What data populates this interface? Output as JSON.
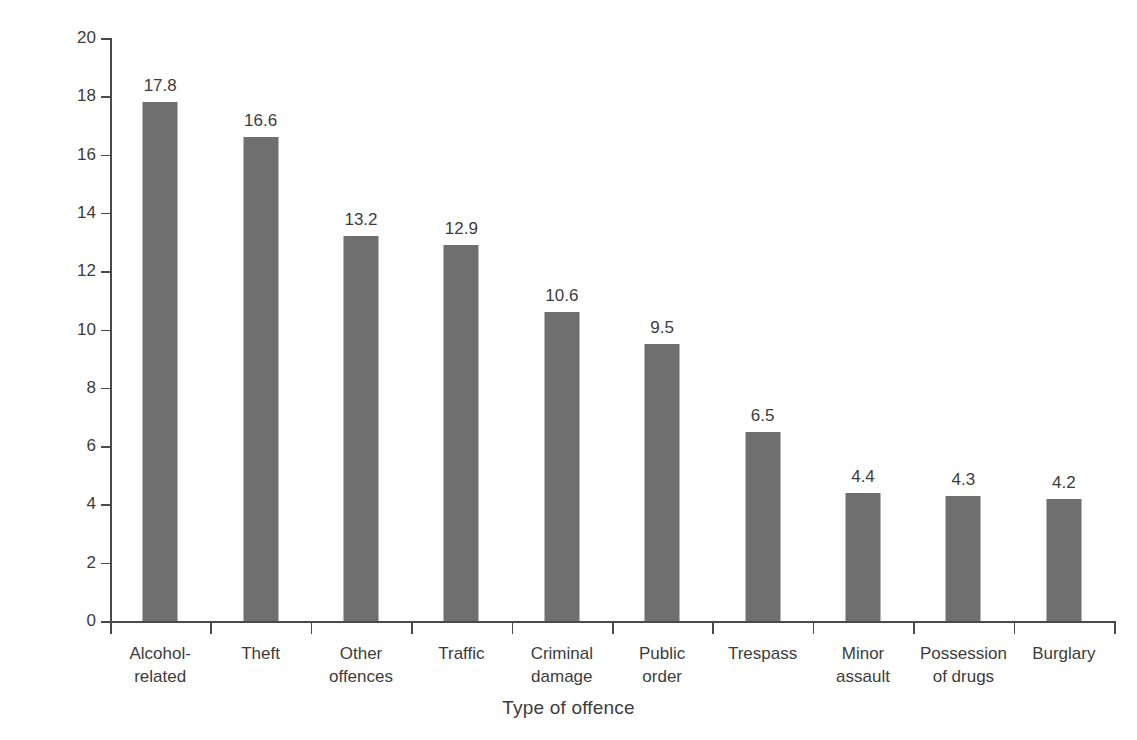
{
  "chart_data": {
    "type": "bar",
    "title": "",
    "xlabel": "Type of offence",
    "ylabel": "% of referrals",
    "categories": [
      "Alcohol-\nrelated",
      "Theft",
      "Other\noffences",
      "Traffic",
      "Criminal\ndamage",
      "Public\norder",
      "Trespass",
      "Minor\nassault",
      "Possession\nof drugs",
      "Burglary"
    ],
    "values": [
      17.8,
      16.6,
      13.2,
      12.9,
      10.6,
      9.5,
      6.5,
      4.4,
      4.3,
      4.2
    ],
    "value_labels": [
      "17.8",
      "16.6",
      "13.2",
      "12.9",
      "10.6",
      "9.5",
      "6.5",
      "4.4",
      "4.3",
      "4.2"
    ],
    "ylim": [
      0,
      20
    ],
    "ytick_values": [
      0,
      2,
      4,
      6,
      8,
      10,
      12,
      14,
      16,
      18,
      20
    ],
    "ytick_labels": [
      "0",
      "2",
      "4",
      "6",
      "8",
      "10",
      "12",
      "14",
      "16",
      "18",
      "20"
    ],
    "grid": false,
    "legend": false,
    "bar_color": "#6f6f6f",
    "axis_color": "#4a4a4a",
    "text_color": "#3c3c3c",
    "background_color": "#ffffff"
  }
}
